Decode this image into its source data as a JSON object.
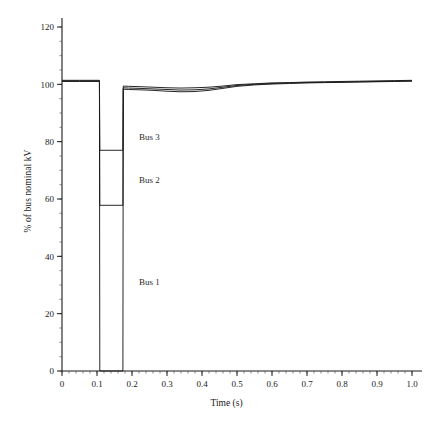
{
  "chart_data": {
    "type": "line",
    "title": "",
    "xlabel": "Time (s)",
    "ylabel": "% of bus nominal kV",
    "xlim": [
      0,
      1.0
    ],
    "ylim": [
      0,
      120
    ],
    "xticks": [
      "0",
      "0.1",
      "0.2",
      "0.3",
      "0.4",
      "0.5",
      "0.6",
      "0.7",
      "0.8",
      "0.9",
      "1.0"
    ],
    "xtick_values": [
      0,
      0.1,
      0.2,
      0.3,
      0.4,
      0.5,
      0.6,
      0.7,
      0.8,
      0.9,
      1.0
    ],
    "yticks": [
      "0",
      "20",
      "40",
      "60",
      "80",
      "100",
      "120"
    ],
    "ytick_values": [
      0,
      20,
      40,
      60,
      80,
      100,
      120
    ],
    "y_minor_step": 5,
    "x_minor_step": 0.02,
    "grid": false,
    "legend": "inline-annotations",
    "line_color": "#1a1a1a",
    "fault_start": 0.108,
    "fault_clear": 0.175,
    "annotations": [
      {
        "label": "Bus 3",
        "x": 0.22,
        "y": 80.5
      },
      {
        "label": "Bus 2",
        "x": 0.22,
        "y": 65.5
      },
      {
        "label": "Bus 1",
        "x": 0.22,
        "y": 30.0
      }
    ],
    "series": [
      {
        "name": "Bus 1",
        "x": [
          0,
          0.05,
          0.107,
          0.108,
          0.14,
          0.174,
          0.175,
          0.19,
          0.22,
          0.26,
          0.3,
          0.34,
          0.38,
          0.42,
          0.46,
          0.5,
          0.55,
          0.6,
          0.65,
          0.7,
          0.75,
          0.8,
          0.85,
          0.9,
          0.95,
          1.0
        ],
        "y": [
          101.0,
          101.0,
          101.0,
          0.0,
          0.0,
          0.0,
          98.3,
          98.2,
          98.1,
          97.9,
          97.6,
          97.4,
          97.5,
          97.9,
          98.6,
          99.3,
          99.8,
          100.1,
          100.3,
          100.5,
          100.6,
          100.7,
          100.8,
          100.9,
          101.0,
          101.1
        ]
      },
      {
        "name": "Bus 2",
        "x": [
          0,
          0.05,
          0.107,
          0.108,
          0.14,
          0.174,
          0.175,
          0.19,
          0.22,
          0.26,
          0.3,
          0.34,
          0.38,
          0.42,
          0.46,
          0.5,
          0.55,
          0.6,
          0.65,
          0.7,
          0.75,
          0.8,
          0.85,
          0.9,
          0.95,
          1.0
        ],
        "y": [
          101.2,
          101.2,
          101.2,
          57.8,
          57.8,
          57.8,
          98.8,
          98.7,
          98.6,
          98.4,
          98.2,
          98.0,
          98.1,
          98.4,
          99.0,
          99.6,
          100.0,
          100.3,
          100.5,
          100.6,
          100.7,
          100.8,
          100.9,
          101.0,
          101.1,
          101.2
        ]
      },
      {
        "name": "Bus 3",
        "x": [
          0,
          0.05,
          0.107,
          0.108,
          0.14,
          0.174,
          0.175,
          0.19,
          0.22,
          0.26,
          0.3,
          0.34,
          0.38,
          0.42,
          0.46,
          0.5,
          0.55,
          0.6,
          0.65,
          0.7,
          0.75,
          0.8,
          0.85,
          0.9,
          0.95,
          1.0
        ],
        "y": [
          101.4,
          101.4,
          101.4,
          77.0,
          77.0,
          77.0,
          99.4,
          99.3,
          99.2,
          99.0,
          98.8,
          98.7,
          98.8,
          99.0,
          99.4,
          99.9,
          100.2,
          100.5,
          100.6,
          100.8,
          100.9,
          101.0,
          101.1,
          101.2,
          101.3,
          101.4
        ]
      }
    ]
  }
}
